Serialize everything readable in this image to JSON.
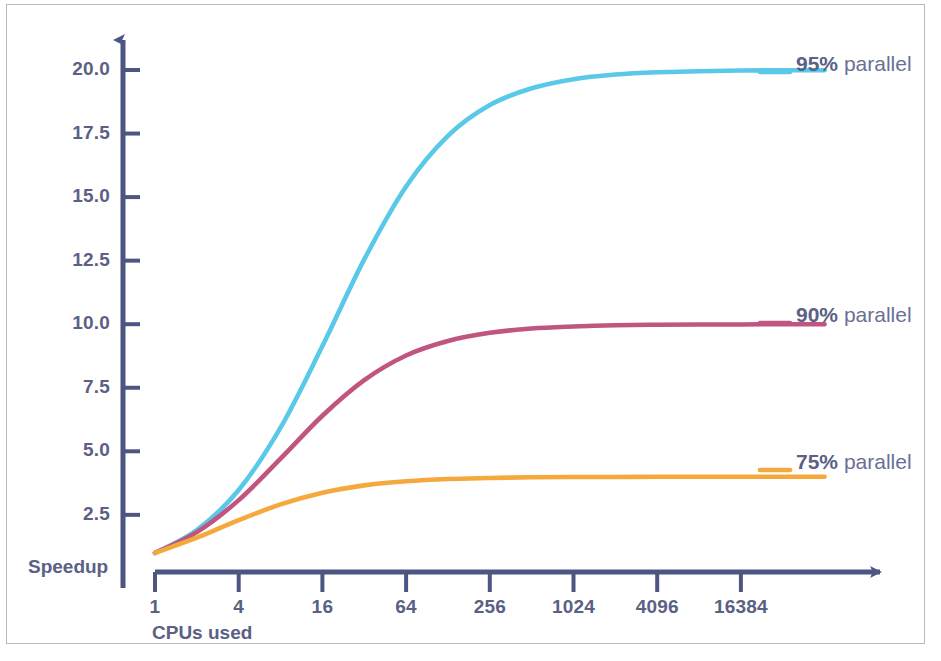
{
  "chart_data": {
    "type": "line",
    "title": "",
    "subtitle": "",
    "xlabel": "CPUs used",
    "ylabel": "Speedup",
    "xscale": "log",
    "xticks": [
      1,
      4,
      16,
      64,
      256,
      1024,
      4096,
      16384
    ],
    "xtick_labels": [
      "1",
      "4",
      "16",
      "64",
      "256",
      "1024",
      "4096",
      "16384"
    ],
    "xlim": [
      1,
      65536
    ],
    "yticks": [
      2.5,
      5.0,
      7.5,
      10.0,
      12.5,
      15.0,
      17.5,
      20.0
    ],
    "ytick_labels": [
      "2.5",
      "5.0",
      "7.5",
      "10.0",
      "12.5",
      "15.0",
      "17.5",
      "20.0"
    ],
    "ylim": [
      0,
      21.5
    ],
    "grid": false,
    "legend_position": "right-inline",
    "series": [
      {
        "name": "95% parallel",
        "pct": "95%",
        "word": "parallel",
        "color": "#5ac8e8",
        "parallel_fraction": 0.95,
        "asymptote": 20.0,
        "x": [
          1,
          2,
          4,
          8,
          16,
          32,
          64,
          128,
          256,
          512,
          1024,
          2048,
          4096,
          8192,
          16384,
          32768,
          65536
        ],
        "values": [
          1.0,
          1.9,
          3.48,
          5.93,
          9.14,
          12.55,
          15.42,
          17.41,
          18.62,
          19.28,
          19.64,
          19.82,
          19.91,
          19.95,
          19.98,
          19.99,
          19.99
        ]
      },
      {
        "name": "90% parallel",
        "pct": "90%",
        "word": "parallel",
        "color": "#c0557f",
        "parallel_fraction": 0.9,
        "asymptote": 10.0,
        "x": [
          1,
          2,
          4,
          8,
          16,
          32,
          64,
          128,
          256,
          512,
          1024,
          2048,
          4096,
          8192,
          16384,
          32768,
          65536
        ],
        "values": [
          1.0,
          1.82,
          3.08,
          4.71,
          6.4,
          7.8,
          8.77,
          9.34,
          9.66,
          9.83,
          9.91,
          9.96,
          9.98,
          9.99,
          9.99,
          10.0,
          10.0
        ]
      },
      {
        "name": "75% parallel",
        "pct": "75%",
        "word": "parallel",
        "color": "#f5a93c",
        "parallel_fraction": 0.75,
        "asymptote": 4.0,
        "x": [
          1,
          2,
          4,
          8,
          16,
          32,
          64,
          128,
          256,
          512,
          1024,
          2048,
          4096,
          8192,
          16384,
          32768,
          65536
        ],
        "values": [
          1.0,
          1.6,
          2.29,
          2.91,
          3.37,
          3.66,
          3.82,
          3.91,
          3.95,
          3.98,
          3.99,
          3.99,
          4.0,
          4.0,
          4.0,
          4.0,
          4.0
        ]
      }
    ]
  },
  "axes": {
    "y_axis_title": "Speedup",
    "x_axis_title": "CPUs used",
    "axis_color": "#4d5583"
  },
  "labels": {
    "series_95": {
      "pct": "95%",
      "word": "parallel"
    },
    "series_90": {
      "pct": "90%",
      "word": "parallel"
    },
    "series_75": {
      "pct": "75%",
      "word": "parallel"
    }
  }
}
